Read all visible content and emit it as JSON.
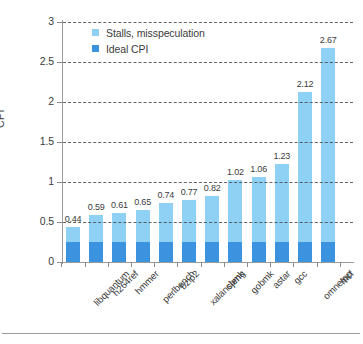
{
  "chart_data": {
    "type": "bar",
    "title": "",
    "subtitle": "",
    "xlabel": "",
    "ylabel": "CPI",
    "ylim": [
      0,
      3
    ],
    "ytick_labels": [
      "0",
      "0.5",
      "1",
      "1.5",
      "2",
      "2.5",
      "3"
    ],
    "ytick_values": [
      0,
      0.5,
      1,
      1.5,
      2,
      2.5,
      3
    ],
    "grid": "horizontal-dashed",
    "stacked": true,
    "legend_position": "top-left-inside",
    "categories": [
      "libquantum",
      "h264ref",
      "hmmer",
      "perlbench",
      "bzip2",
      "xalancbmk",
      "sjeng",
      "gobmk",
      "astar",
      "gcc",
      "omnetpp",
      "mcf"
    ],
    "totals": [
      0.44,
      0.59,
      0.61,
      0.65,
      0.74,
      0.77,
      0.82,
      1.02,
      1.06,
      1.23,
      2.12,
      2.67
    ],
    "data_labels": [
      "0.44",
      "0.59",
      "0.61",
      "0.65",
      "0.74",
      "0.77",
      "0.82",
      "1.02",
      "1.06",
      "1.23",
      "2.12",
      "2.67"
    ],
    "series": [
      {
        "name": "Ideal CPI",
        "color": "#3b93e0",
        "values": [
          0.25,
          0.25,
          0.25,
          0.25,
          0.25,
          0.25,
          0.25,
          0.25,
          0.25,
          0.25,
          0.25,
          0.25
        ]
      },
      {
        "name": "Stalls, misspeculation",
        "color": "#8ed1f5",
        "values": [
          0.19,
          0.34,
          0.36,
          0.4,
          0.49,
          0.52,
          0.57,
          0.77,
          0.81,
          0.98,
          1.87,
          2.42
        ]
      }
    ],
    "legend": [
      {
        "label": "Stalls, misspeculation",
        "color": "#8ed1f5"
      },
      {
        "label": "Ideal CPI",
        "color": "#3b93e0"
      }
    ]
  }
}
